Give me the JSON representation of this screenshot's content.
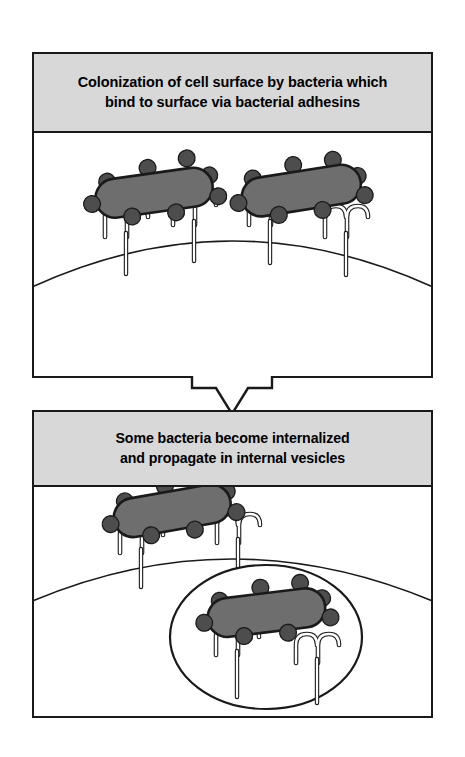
{
  "figure": {
    "background_color": "#ffffff"
  },
  "colors": {
    "header_band": "#d8d8d8",
    "outline": "#1a1a1a",
    "bacterium_body": "#6e6e6e",
    "bacterium_outline": "#1a1a1a",
    "adhesin_dot": "#4d4d4d",
    "receptor_fill": "#ffffff",
    "receptor_outline": "#1a1a1a",
    "cell_interior": "#ffffff",
    "vesicle_fill": "#ffffff",
    "arrow_fill": "#ffffff"
  },
  "panels": [
    {
      "id": "panel-top",
      "header_text": "Colonization of cell surface by bacteria which\nbind to surface via bacterial adhesins",
      "scene_name": "cell-surface-colonization-scene",
      "bacteria_count": 2,
      "receptor_count": 4,
      "vesicle_count": 0,
      "adhesins_per_bacterium": 8
    },
    {
      "id": "panel-bottom",
      "header_text": "Some bacteria become internalized\nand propagate in internal vesicles",
      "scene_name": "bacterial-internalization-scene",
      "bacteria_count": 2,
      "receptor_count": 4,
      "vesicle_count": 1,
      "adhesins_per_bacterium": 8
    }
  ],
  "arrow": {
    "name": "flow-arrow-down",
    "direction": "down",
    "label": ""
  },
  "legend_labels": {
    "bacterium": "bacterium",
    "adhesin": "bacterial adhesin",
    "receptor": "host surface receptor",
    "cell_surface": "host cell surface",
    "vesicle": "internal vesicle"
  }
}
